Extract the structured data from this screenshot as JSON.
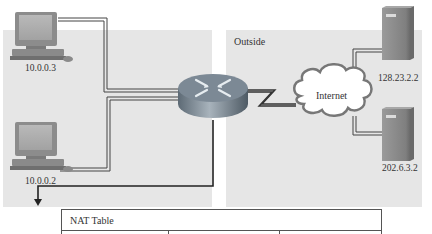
{
  "zones": {
    "inside": {
      "label": ""
    },
    "outside": {
      "label": "Outside"
    }
  },
  "hosts": [
    {
      "id": "pc-top",
      "type": "pc",
      "label": "10.0.0.3"
    },
    {
      "id": "pc-bottom",
      "type": "pc",
      "label": "10.0.0.2"
    }
  ],
  "router": {
    "label": ""
  },
  "cloud": {
    "label": "Internet"
  },
  "servers": [
    {
      "id": "server-top",
      "type": "server",
      "label": "128.23.2.2"
    },
    {
      "id": "server-bottom",
      "type": "server",
      "label": "202.6.3.2"
    }
  ],
  "nat_table": {
    "title": "NAT Table",
    "columns": [
      "",
      "",
      ""
    ]
  },
  "colors": {
    "zone_bg": "#e6e6e6",
    "line": "#333333",
    "router_body": "#7a8a98",
    "server_body": "#8a8a8a"
  }
}
